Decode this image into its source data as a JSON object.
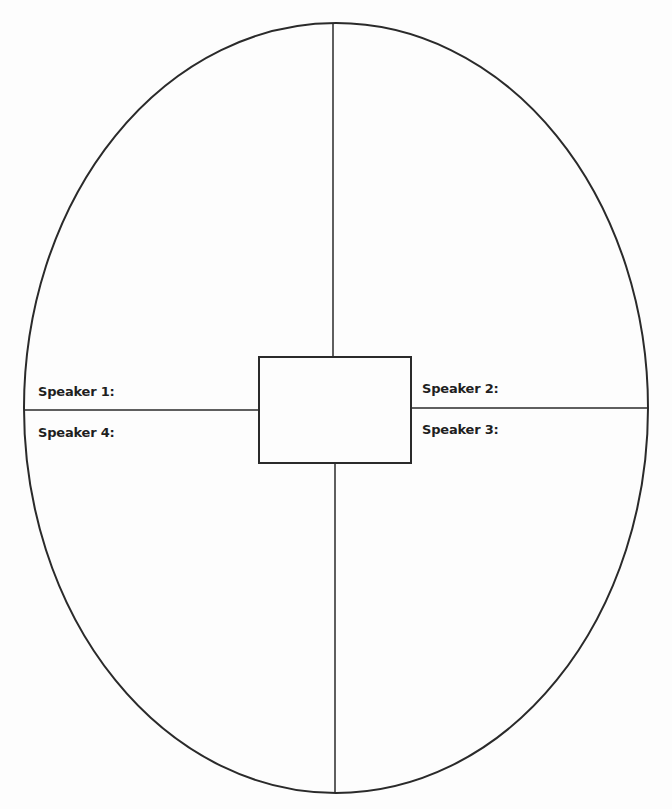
{
  "diagram": {
    "type": "discussion-organizer",
    "shape": "ellipse-divided-into-quadrants",
    "center_box_text": "",
    "speakers": [
      {
        "id": 1,
        "label": "Speaker 1:",
        "quadrant": "top-left"
      },
      {
        "id": 2,
        "label": "Speaker 2:",
        "quadrant": "top-right"
      },
      {
        "id": 3,
        "label": "Speaker 3:",
        "quadrant": "bottom-right"
      },
      {
        "id": 4,
        "label": "Speaker 4:",
        "quadrant": "bottom-left"
      }
    ],
    "colors": {
      "stroke": "#2a2a2a",
      "background": "#fdfdfd",
      "text": "#1f1f1f"
    }
  }
}
